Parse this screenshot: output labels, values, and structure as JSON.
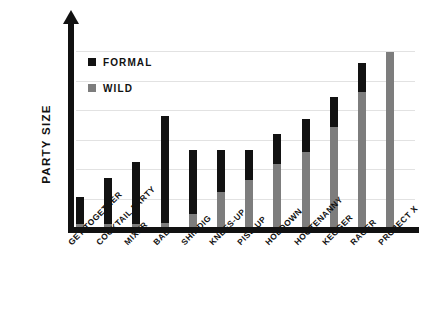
{
  "chart_data": {
    "type": "bar",
    "subtype": "stacked",
    "title": "",
    "xlabel": "",
    "ylabel": "PARTY SIZE",
    "grid": true,
    "gridlines": 6,
    "ylim": [
      0,
      6.6
    ],
    "yticks": [],
    "legend_position": "top-left",
    "categories": [
      "GET-TOGETHER",
      "COCKTAIL PARTY",
      "MIXER",
      "BALL",
      "SHINDIG",
      "KNEES-UP",
      "PISS-UP",
      "HOEDOWN",
      "HOOTENANNY",
      "KEGGER",
      "RAGER",
      "PROJECT X"
    ],
    "series": [
      {
        "name": "WILD",
        "color": "#7d7d7d",
        "values": [
          0.12,
          0.12,
          0.12,
          0.15,
          0.45,
          1.15,
          1.55,
          2.05,
          2.45,
          3.25,
          4.35,
          5.65
        ]
      },
      {
        "name": "FORMAL",
        "color": "#121212",
        "values": [
          0.88,
          1.48,
          1.98,
          3.45,
          2.05,
          1.35,
          0.95,
          0.95,
          1.05,
          0.95,
          0.95,
          0.0
        ]
      }
    ],
    "totals": [
      1.0,
      1.6,
      2.1,
      3.6,
      2.5,
      2.5,
      2.5,
      3.0,
      3.5,
      4.2,
      5.3,
      5.65
    ]
  },
  "legend": {
    "items": [
      {
        "label": "FORMAL",
        "swatch": "formal-swatch"
      },
      {
        "label": "WILD",
        "swatch": "wild-swatch"
      }
    ]
  },
  "axis": {
    "y_title": "PARTY SIZE"
  }
}
